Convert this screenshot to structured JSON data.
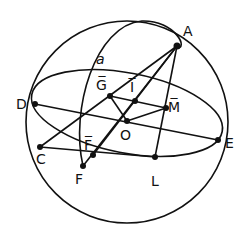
{
  "diagram": {
    "type": "celestial-sphere-construction",
    "colors": {
      "ink": "#111111",
      "background": "#ffffff"
    },
    "sphere": {
      "cx": 127,
      "cy": 122,
      "r": 101
    },
    "equator_ellipse": {
      "cx": 127,
      "cy": 113,
      "rx": 97,
      "ry": 40,
      "rotate": 11
    },
    "meridian_arc_label": "a",
    "points": [
      {
        "id": "A",
        "label": "A",
        "x": 177,
        "y": 46,
        "lx": 183,
        "ly": 36
      },
      {
        "id": "D",
        "label": "D",
        "x": 35,
        "y": 104,
        "lx": 16,
        "ly": 109
      },
      {
        "id": "E",
        "label": "E",
        "x": 218,
        "y": 140,
        "lx": 225,
        "ly": 148
      },
      {
        "id": "C",
        "label": "C",
        "x": 40,
        "y": 147,
        "lx": 36,
        "ly": 164
      },
      {
        "id": "F",
        "label": "F",
        "x": 83,
        "y": 166,
        "lx": 75,
        "ly": 184
      },
      {
        "id": "L",
        "label": "L",
        "x": 155,
        "y": 157,
        "lx": 151,
        "ly": 186
      },
      {
        "id": "O",
        "label": "O",
        "x": 127,
        "y": 121,
        "lx": 120,
        "ly": 140
      },
      {
        "id": "G_bar",
        "label": "G̅",
        "x": 110,
        "y": 96,
        "lx": 96,
        "ly": 90
      },
      {
        "id": "I_bar",
        "label": "I̅",
        "x": 135,
        "y": 101,
        "lx": 130,
        "ly": 92
      },
      {
        "id": "M_bar",
        "label": "M̅",
        "x": 166,
        "y": 108,
        "lx": 168,
        "ly": 112
      },
      {
        "id": "F_bar",
        "label": "F̅",
        "x": 93,
        "y": 155,
        "lx": 84,
        "ly": 150
      }
    ],
    "segments": [
      [
        "D",
        "E"
      ],
      [
        "C",
        "L"
      ],
      [
        "C",
        "A"
      ],
      [
        "F",
        "A"
      ],
      [
        "F_bar",
        "A"
      ],
      [
        "A",
        "L"
      ],
      [
        "G_bar",
        "M_bar"
      ],
      [
        "G_bar",
        "O"
      ],
      [
        "O",
        "M_bar"
      ]
    ]
  }
}
